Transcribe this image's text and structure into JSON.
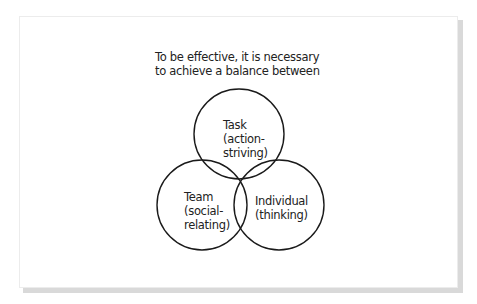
{
  "diagram": {
    "caption_line1": "To be effective, it is necessary",
    "caption_line2": "to achieve a balance between",
    "circles": [
      {
        "id": "task",
        "line1": "Task",
        "line2": "(action-",
        "line3": "striving)"
      },
      {
        "id": "team",
        "line1": "Team",
        "line2": "(social-",
        "line3": "relating)"
      },
      {
        "id": "individual",
        "line1": "Individual",
        "line2": "(thinking)"
      }
    ],
    "stroke_color": "#1a1a1a"
  }
}
